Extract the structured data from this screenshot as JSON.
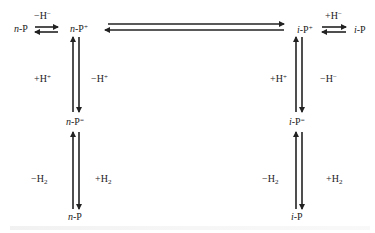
{
  "diagram": {
    "type": "reaction-scheme",
    "nodes": {
      "n_p_left": {
        "prefix": "n",
        "base": "-P",
        "charge": ""
      },
      "n_p_plus": {
        "prefix": "n",
        "base": "-P",
        "charge": "+"
      },
      "i_p_plus": {
        "prefix": "i",
        "base": "-P",
        "charge": "+"
      },
      "i_p_right": {
        "prefix": "i",
        "base": "-P",
        "charge": ""
      },
      "n_p_eq": {
        "prefix": "n",
        "base": "-P",
        "charge": "="
      },
      "i_p_eq": {
        "prefix": "i",
        "base": "-P",
        "charge": "="
      },
      "n_p_bottom": {
        "prefix": "n",
        "base": "-P",
        "charge": ""
      },
      "i_p_bottom": {
        "prefix": "i",
        "base": "-P",
        "charge": ""
      }
    },
    "edge_labels": {
      "top_left": {
        "sign": "−H",
        "sup": "−"
      },
      "top_right": {
        "sign": "+H",
        "sup": "−"
      },
      "left_upper_left": {
        "sign": "+H",
        "sup": "+"
      },
      "left_upper_right": {
        "sign": "−H",
        "sup": "+"
      },
      "left_lower_left": {
        "sign": "−H",
        "sub": "2"
      },
      "left_lower_right": {
        "sign": "+H",
        "sub": "2"
      },
      "right_upper_left": {
        "sign": "+H",
        "sup": "+"
      },
      "right_upper_right": {
        "sign": "−H",
        "sup": "−"
      },
      "right_lower_left": {
        "sign": "−H",
        "sub": "2"
      },
      "right_lower_right": {
        "sign": "+H",
        "sub": "2"
      }
    },
    "edges": [
      {
        "from": "n_p_left",
        "to": "n_p_plus",
        "type": "equilibrium",
        "label": "top_left"
      },
      {
        "from": "n_p_plus",
        "to": "i_p_plus",
        "type": "equilibrium"
      },
      {
        "from": "i_p_plus",
        "to": "i_p_right",
        "type": "equilibrium",
        "label": "top_right"
      },
      {
        "from": "n_p_plus",
        "to": "n_p_eq",
        "type": "equilibrium",
        "labels": [
          "left_upper_left",
          "left_upper_right"
        ]
      },
      {
        "from": "n_p_eq",
        "to": "n_p_bottom",
        "type": "equilibrium",
        "labels": [
          "left_lower_left",
          "left_lower_right"
        ]
      },
      {
        "from": "i_p_plus",
        "to": "i_p_eq",
        "type": "equilibrium",
        "labels": [
          "right_upper_left",
          "right_upper_right"
        ]
      },
      {
        "from": "i_p_eq",
        "to": "i_p_bottom",
        "type": "equilibrium",
        "labels": [
          "right_lower_left",
          "right_lower_right"
        ]
      }
    ],
    "colors": {
      "ink": "#222222",
      "background": "#ffffff"
    }
  }
}
